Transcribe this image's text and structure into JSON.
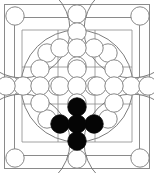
{
  "board": {
    "title": "abstract board diagram",
    "width": 154,
    "height": 173,
    "colors": {
      "background": "#ffffff",
      "line": "#8a8a8a",
      "circle_outline": "#7a7a7a",
      "stone_black": "#050505",
      "stone_white": "#ffffff"
    },
    "outer_frame": {
      "x": 4,
      "y": 4,
      "width": 146,
      "height": 165
    },
    "inner_frame": {
      "x": 14,
      "y": 17,
      "width": 126,
      "height": 139
    },
    "play_square": {
      "x": 22,
      "y": 30,
      "width": 110,
      "height": 112
    },
    "inscribed_circle": {
      "cx": 77,
      "cy": 86,
      "r": 56
    },
    "grid": {
      "rows": 3,
      "cols": 3,
      "x_lines": [
        22,
        58,
        95,
        132
      ],
      "y_lines": [
        30,
        67,
        104,
        142
      ]
    },
    "stone_radius": 9.2,
    "edge_stone_radius": 9.2,
    "frame_stones": [
      {
        "name": "corner-top-left",
        "cx": 15,
        "cy": 16,
        "state": "empty"
      },
      {
        "name": "edge-top-center",
        "cx": 77,
        "cy": 14,
        "state": "empty"
      },
      {
        "name": "corner-top-right",
        "cx": 140,
        "cy": 16,
        "state": "empty"
      },
      {
        "name": "edge-left-middle",
        "cx": 11,
        "cy": 86,
        "state": "empty"
      },
      {
        "name": "edge-right-middle",
        "cx": 143,
        "cy": 86,
        "state": "empty"
      },
      {
        "name": "corner-bottom-left",
        "cx": 15,
        "cy": 158,
        "state": "empty"
      },
      {
        "name": "edge-bottom-center",
        "cx": 77,
        "cy": 159,
        "state": "empty"
      },
      {
        "name": "corner-bottom-right",
        "cx": 140,
        "cy": 158,
        "state": "empty"
      }
    ],
    "clusters": [
      {
        "name": "cluster-north",
        "cell": "top-center",
        "shape": "plus",
        "state": "empty",
        "center": {
          "cx": 77,
          "cy": 48
        },
        "stones": [
          {
            "name": "north-center",
            "cx": 77,
            "cy": 48,
            "state": "empty"
          },
          {
            "name": "north-up",
            "cx": 77,
            "cy": 32,
            "state": "empty"
          },
          {
            "name": "north-down",
            "cx": 77,
            "cy": 66,
            "state": "empty"
          },
          {
            "name": "north-left",
            "cx": 60,
            "cy": 48,
            "state": "empty"
          },
          {
            "name": "north-right",
            "cx": 94,
            "cy": 48,
            "state": "empty"
          }
        ]
      },
      {
        "name": "cluster-west",
        "cell": "middle-left",
        "shape": "plus",
        "state": "empty",
        "center": {
          "cx": 40,
          "cy": 86
        },
        "stones": [
          {
            "name": "west-center",
            "cx": 40,
            "cy": 86,
            "state": "empty"
          },
          {
            "name": "west-up",
            "cx": 40,
            "cy": 69,
            "state": "empty"
          },
          {
            "name": "west-down",
            "cx": 40,
            "cy": 103,
            "state": "empty"
          },
          {
            "name": "west-left",
            "cx": 23,
            "cy": 86,
            "state": "empty"
          },
          {
            "name": "west-right",
            "cx": 57,
            "cy": 86,
            "state": "empty"
          }
        ]
      },
      {
        "name": "cluster-center",
        "cell": "middle-center",
        "shape": "plus",
        "state": "empty",
        "center": {
          "cx": 77,
          "cy": 86
        },
        "stones": [
          {
            "name": "center-center",
            "cx": 77,
            "cy": 86,
            "state": "empty"
          },
          {
            "name": "center-up",
            "cx": 77,
            "cy": 69,
            "state": "empty"
          },
          {
            "name": "center-down",
            "cx": 77,
            "cy": 103,
            "state": "empty"
          },
          {
            "name": "center-left",
            "cx": 60,
            "cy": 86,
            "state": "empty"
          },
          {
            "name": "center-right",
            "cx": 94,
            "cy": 86,
            "state": "empty"
          }
        ]
      },
      {
        "name": "cluster-east",
        "cell": "middle-right",
        "shape": "plus",
        "state": "empty",
        "center": {
          "cx": 114,
          "cy": 86
        },
        "stones": [
          {
            "name": "east-center",
            "cx": 114,
            "cy": 86,
            "state": "empty"
          },
          {
            "name": "east-up",
            "cx": 114,
            "cy": 69,
            "state": "empty"
          },
          {
            "name": "east-down",
            "cx": 114,
            "cy": 103,
            "state": "empty"
          },
          {
            "name": "east-left",
            "cx": 97,
            "cy": 86,
            "state": "empty"
          },
          {
            "name": "east-right",
            "cx": 131,
            "cy": 86,
            "state": "empty"
          }
        ]
      },
      {
        "name": "cluster-south",
        "cell": "bottom-center",
        "shape": "plus",
        "state": "filled-black",
        "center": {
          "cx": 77,
          "cy": 124
        },
        "stones": [
          {
            "name": "south-center",
            "cx": 77,
            "cy": 124,
            "state": "black"
          },
          {
            "name": "south-up",
            "cx": 77,
            "cy": 107,
            "state": "black"
          },
          {
            "name": "south-down",
            "cx": 77,
            "cy": 141,
            "state": "black"
          },
          {
            "name": "south-left",
            "cx": 60,
            "cy": 124,
            "state": "black"
          },
          {
            "name": "south-right",
            "cx": 94,
            "cy": 124,
            "state": "black"
          }
        ]
      }
    ],
    "diagonal_stones": [
      {
        "name": "diag-top-left",
        "cx": 47,
        "cy": 53,
        "state": "empty"
      },
      {
        "name": "diag-top-right",
        "cx": 108,
        "cy": 53,
        "state": "empty"
      },
      {
        "name": "diag-bottom-left",
        "cx": 47,
        "cy": 119,
        "state": "empty"
      },
      {
        "name": "diag-bottom-right",
        "cx": 108,
        "cy": 119,
        "state": "empty"
      }
    ],
    "edge_row_stones": [
      {
        "name": "row-left-outer",
        "cx": 6,
        "cy": 86,
        "state": "empty"
      },
      {
        "name": "row-right-outer",
        "cx": 148,
        "cy": 86,
        "state": "empty"
      }
    ]
  }
}
